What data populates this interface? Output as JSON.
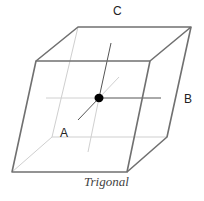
{
  "diagram": {
    "type": "crystal-lattice-cell",
    "caption": "Trigonal",
    "axis_labels": {
      "a": "A",
      "b": "B",
      "c": "C"
    },
    "colors": {
      "edge_dark": "#6e6e6e",
      "edge_light": "#c8c8c8",
      "axis_dark": "#555555",
      "axis_light": "#cccccc",
      "center_dot": "#000000"
    }
  }
}
